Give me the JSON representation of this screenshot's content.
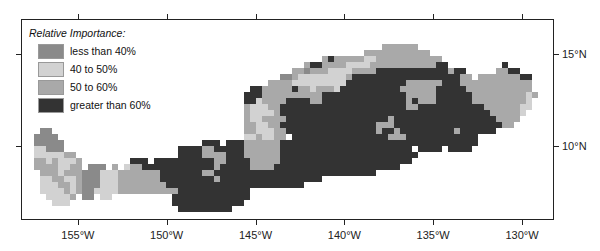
{
  "map": {
    "legend": {
      "title": "Relative Importance:",
      "items": [
        {
          "code": "a",
          "label": "less than 40%",
          "color": "#8a8a8a"
        },
        {
          "code": "b",
          "label": "40 to 50%",
          "color": "#d2d2d2"
        },
        {
          "code": "c",
          "label": "50 to 60%",
          "color": "#a9a9a9"
        },
        {
          "code": "d",
          "label": "greater than 60%",
          "color": "#333333"
        }
      ]
    },
    "x_axis": {
      "ticks": [
        {
          "label": "155°W",
          "lon": -155
        },
        {
          "label": "150°W",
          "lon": -150
        },
        {
          "label": "145°W",
          "lon": -145
        },
        {
          "label": "140°W",
          "lon": -140
        },
        {
          "label": "135°W",
          "lon": -135
        },
        {
          "label": "130°W",
          "lon": -130
        }
      ]
    },
    "y_axis": {
      "ticks": [
        {
          "label": "15°N",
          "lat": 15
        },
        {
          "label": "10°N",
          "lat": 10
        }
      ]
    },
    "extent": {
      "lon_min": -158.2,
      "lon_max": -128.2,
      "lat_min": 6.0,
      "lat_max": 16.9
    },
    "grid_rows": [
      ".........................................................................................",
      ".........................................................................................",
      ".........................................................................................",
      ".........................................................................................",
      "............................................................cccccc.......................",
      ".........................................................ccccccccccc.....................",
      "..................................................cdcccccbbccccccccccc...................",
      "...............................................cddccccbbbbcccccccccccdd.........d.......",
      ".............................................ccacccbbbbccccddddddddddddcdd.....ccdd......",
      "...........................................aacbbbbbbbbcddddddddddddddddddcc.cccccccdd....",
      ".........................................ccccbbbbbbbbbddddddddddccccccdddcccccccccccc....",
      "......................................ddcccccdccbcccbddddddddddccccccdddddccccccccccc....",
      ".....................................dddccccccccccddddddddddddddcccccddddddcccccccccbc....",
      ".....................................ddbccccddddccddddddddddddddcdcccddddddcccccccccb.....",
      ".....................................cbbbccdddddddddddddddddddddccdddddddddddccccccbb.....",
      ".....................................cbbbbcdddddddddddddddddddddddddddddddddddcccccb......",
      ".....................................cbbccccdddddddddddddddddcdddddddddddddddddcccc.......",
      ".....................................ccbbccddddddddddddddddcccddddddddddddddddddcc........",
      "...aa................................ccbbbccdddddddddddddddcddcdddddddddcdddddd..........",
      "..aaaa...............................bbcbbcc.ddddddddddddddddcccdddddddddddd.............",
      "..aaaaa.......................ddd.dddccccccddddddddddddddddddddddddddddddddd.............",
      "..bbaaa...................ddddccdddddccccccdddddddddddddddddddddd.dddd.dddd..............",
      "..bbbbbcc.................ddddccccdddccccccddddddddddddddddddddddd........................",
      "..ccbcbbbc........ddd.ddddddddddccddddcccccdddddddddddddddddddddd........................",
      "..ccccbbcc.aaa.c.bccddddddddddddcdddddccccddddddddddddddddddddd..........................",
      "...cccbcccaaabbbcccccccdddddddccddddddddddddddddddddddddddd..............................",
      "...bbccbbcaaabbbcccccccdddddddddcddddddddddddddddd.......................................",
      "...bbbccbcaaabbbccccccccddddddddddddddddddddddd...........................................",
      "...bbbbcbcaabbbbccccccccccdddddddddddd.....................................................",
      "....bbbbc.aa.bb..........ddddddddddddd.....................................................",
      ".....bbb.................dddddddddddd.....................................................",
      "..........................ddddddddd......................................................",
      ".........................................................................................",
      "........................................................................................."
    ]
  }
}
